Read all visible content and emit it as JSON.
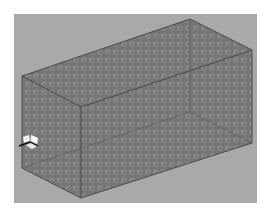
{
  "viewport": {
    "background_color": "#a9a9a9",
    "frame": {
      "x": 14,
      "y": 14,
      "width": 243,
      "height": 189
    }
  },
  "box": {
    "face_color": "#7d7d7d",
    "edge_color": "#4a4a4a",
    "hidden_edge_color": "#5e5e5e",
    "texture": "dimpled",
    "vertices": {
      "top_back": [
        190,
        19
      ],
      "top_right": [
        252,
        50
      ],
      "top_left": [
        22,
        76
      ],
      "top_front": [
        81,
        107
      ],
      "bottom_back": [
        190,
        112
      ],
      "bottom_right": [
        252,
        143
      ],
      "bottom_left": [
        22,
        168
      ],
      "bottom_front": [
        81,
        198
      ]
    }
  },
  "axis_triad": {
    "position": [
      30,
      143
    ],
    "icon": "axis-triad-icon"
  }
}
